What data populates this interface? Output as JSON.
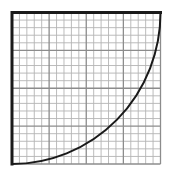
{
  "diagram": {
    "type": "graph-paper-curve",
    "grid": {
      "minor_divisions_x": 20,
      "minor_divisions_y": 20,
      "major_every": 5,
      "minor_color": "#b4b4b4",
      "major_color": "#8c8c8c",
      "border_color": "#1a1a1a"
    },
    "frame": {
      "left": 12,
      "top": 12.5,
      "width": 148.5,
      "height": 151.5,
      "thick_edges": [
        "top",
        "left"
      ]
    },
    "curve": {
      "shape": "quarter-circle",
      "center": "top-left",
      "start": "bottom-left",
      "end": "top-right",
      "color": "#1a1a1a",
      "stroke_width": 2
    }
  }
}
